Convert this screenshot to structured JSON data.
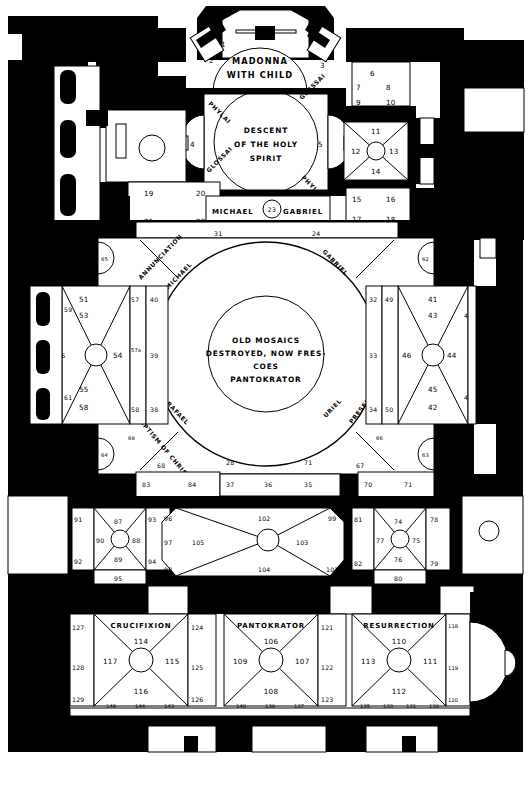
{
  "document": {
    "type": "architectural-floor-plan",
    "subject": "Byzantine church mosaic / fresco program plan"
  },
  "zones": {
    "north_apse": {
      "caption_line1": "MADONNA",
      "caption_line2": "WITH CHILD",
      "numbers": [
        "1",
        "2",
        "3"
      ]
    },
    "narthex_dome": {
      "caption_line1": "DESCENT",
      "caption_line2": "OF THE HOLY",
      "caption_line3": "SPIRIT",
      "corner_labels": [
        "PHYLAI",
        "GLOSSAI",
        "GLOSSAI",
        "PHYLAI"
      ],
      "side_numbers": [
        "4",
        "5"
      ]
    },
    "archangel_band": {
      "left_label": "MICHAEL",
      "center_number": "23",
      "right_label": "GABRIEL",
      "below_left": "31",
      "below_right": "24"
    },
    "main_dome": {
      "center_line1": "OLD MOSAICS",
      "center_line2": "DESTROYED, NOW FRES-",
      "center_line3": "COES",
      "center_line4": "PANTOKRATOR",
      "pendentives": [
        "ANNUNCIATION",
        "MICHAEL",
        "GABRIEL",
        "RAFAEL",
        "URIEL",
        "BAPTISM OF CHRIST",
        "PRESENTATION OF CHRIST"
      ],
      "ring_numbers": [
        "30",
        "31",
        "24",
        "29",
        "28",
        "71",
        "68",
        "67"
      ],
      "corner_apse_numbers": [
        "65",
        "62",
        "64",
        "63"
      ]
    },
    "west_bay": {
      "numbers": [
        "51",
        "53",
        "59",
        "54",
        "60",
        "56",
        "61",
        "55",
        "58"
      ],
      "strip_numbers": [
        "57",
        "40",
        "57a",
        "39",
        "58",
        "38"
      ]
    },
    "east_bay": {
      "numbers": [
        "41",
        "43",
        "47",
        "46",
        "44",
        "45",
        "42",
        "48"
      ],
      "strip_numbers": [
        "32",
        "49",
        "33",
        "50",
        "34",
        "50"
      ]
    },
    "north_east_rooms": {
      "upper_numbers": [
        "6",
        "7",
        "8",
        "9",
        "10"
      ],
      "vault_numbers": [
        "11",
        "12",
        "13",
        "14"
      ],
      "lower_numbers": [
        "15",
        "16",
        "17",
        "18"
      ]
    },
    "north_west_rooms": {
      "numbers": [
        "19",
        "20",
        "21",
        "22"
      ]
    },
    "nave_band": {
      "left_numbers": [
        "83",
        "84",
        "85",
        "86"
      ],
      "center_numbers": [
        "37",
        "36",
        "35"
      ],
      "right_numbers": [
        "70",
        "71",
        "72",
        "73"
      ]
    },
    "middle_vaults": {
      "left_bay": [
        "91",
        "87",
        "90",
        "88",
        "92",
        "89",
        "95",
        "93",
        "94"
      ],
      "center_bay": [
        "102",
        "96",
        "97",
        "105",
        "103",
        "99",
        "98",
        "104",
        "101",
        "100"
      ],
      "right_bay": [
        "81",
        "74",
        "77",
        "75",
        "82",
        "76",
        "80",
        "78",
        "79"
      ]
    },
    "south_bays": [
      {
        "caption": "CRUCIFIXION",
        "top": "114",
        "left": "117",
        "right": "115",
        "bottom": "116",
        "side_left": [
          "127",
          "128",
          "129"
        ],
        "side_right": [
          "124",
          "125",
          "126"
        ],
        "footer": [
          "148",
          "144",
          "143"
        ]
      },
      {
        "caption": "PANTOKRATOR",
        "top": "106",
        "left": "109",
        "right": "107",
        "bottom": "108",
        "side_left": [
          "121",
          "122",
          "123"
        ],
        "side_right": [],
        "footer": [
          "140",
          "139",
          "137"
        ]
      },
      {
        "caption": "RESURRECTION",
        "top": "110",
        "left": "113",
        "right": "111",
        "bottom": "112",
        "side_left": [],
        "side_right": [
          "118",
          "119",
          "120"
        ],
        "footer": [
          "135",
          "133",
          "131",
          "130"
        ]
      }
    ]
  },
  "colors": {
    "wall": "#000000",
    "floor": "#ffffff",
    "line": "#000000"
  }
}
